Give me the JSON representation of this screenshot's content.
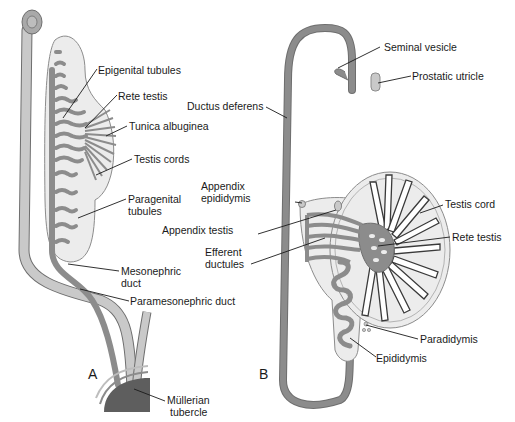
{
  "colors": {
    "duct_dark": "#8c8c8c",
    "duct_light": "#c9c9c9",
    "gonad_fill": "#ececec",
    "outline": "#6e6e6e",
    "text": "#1a1a1a",
    "leader": "#1a1a1a",
    "tubercle": "#5e5e5e"
  },
  "panel_a": {
    "letter": "A",
    "labels": {
      "epigenital_tubules": "Epigenital tubules",
      "rete_testis": "Rete testis",
      "tunica_albuginea": "Tunica albuginea",
      "testis_cords": "Testis cords",
      "paragenital_tubules_1": "Paragenital",
      "paragenital_tubules_2": "tubules",
      "mesonephric_duct_1": "Mesonephric",
      "mesonephric_duct_2": "duct",
      "paramesonephric_duct": "Paramesonephric duct",
      "mullerian_tubercle_1": "Müllerian",
      "mullerian_tubercle_2": "tubercle"
    }
  },
  "panel_b": {
    "letter": "B",
    "labels": {
      "seminal_vesicle": "Seminal vesicle",
      "prostatic_utricle": "Prostatic utricle",
      "ductus_deferens": "Ductus deferens",
      "appendix_epididymis_1": "Appendix",
      "appendix_epididymis_2": "epididymis",
      "appendix_testis": "Appendix testis",
      "efferent_ductules_1": "Efferent",
      "efferent_ductules_2": "ductules",
      "testis_cord": "Testis cord",
      "rete_testis": "Rete testis",
      "paradidymis": "Paradidymis",
      "epididymis": "Epididymis"
    }
  }
}
